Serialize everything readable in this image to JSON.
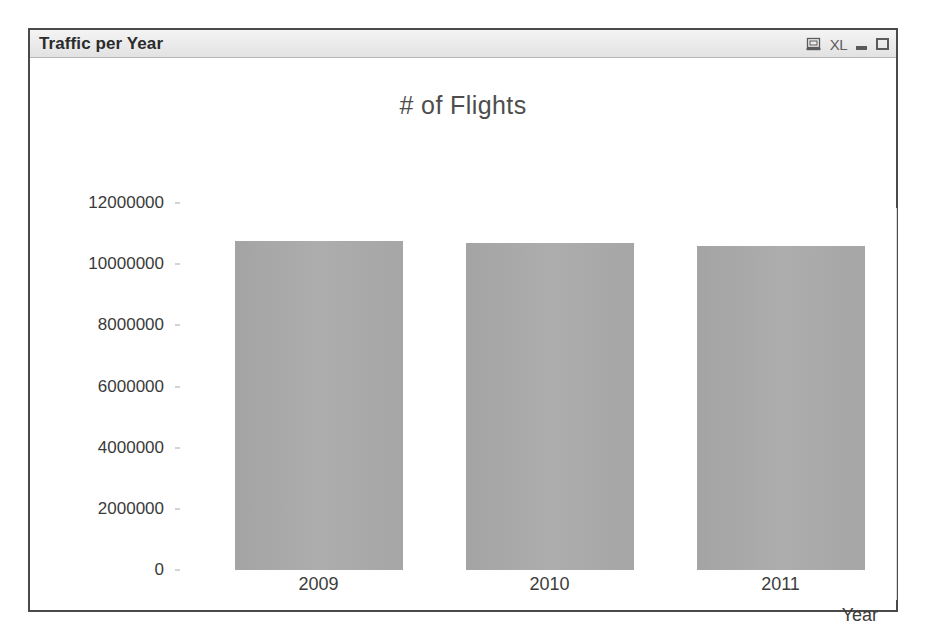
{
  "window": {
    "title": "Traffic per Year",
    "buttons": [
      {
        "name": "export-display-icon",
        "label": ""
      },
      {
        "name": "export-excel-icon",
        "label": "XL"
      },
      {
        "name": "minimize-button",
        "label": ""
      },
      {
        "name": "maximize-button",
        "label": ""
      }
    ]
  },
  "chart_data": {
    "type": "bar",
    "title": "# of Flights",
    "xlabel": "Year",
    "ylabel": "",
    "categories": [
      "2009",
      "2010",
      "2011"
    ],
    "values": [
      10750000,
      10700000,
      10600000
    ],
    "ylim": [
      0,
      12000000
    ],
    "yticks": [
      12000000,
      10000000,
      8000000,
      6000000,
      4000000,
      2000000,
      0
    ],
    "ytick_labels": [
      "12000000",
      "10000000",
      "8000000",
      "6000000",
      "4000000",
      "2000000",
      "0"
    ],
    "grid": false,
    "legend": false,
    "bar_color": "#a8a8a8",
    "background": "#ffffff"
  }
}
